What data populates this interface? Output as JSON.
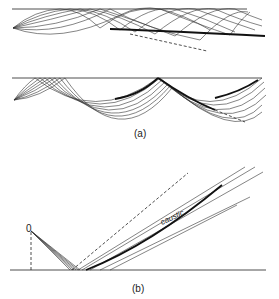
{
  "figure": {
    "panel_a": {
      "label": "(a)",
      "top_diagram": {
        "description": "rays from a source curving up to a boundary and reflecting, forming a caustic"
      },
      "bottom_diagram": {
        "description": "rays from a source bouncing along a boundary with a caustic"
      }
    },
    "panel_b": {
      "label": "(b)",
      "source_label": "0",
      "caustic_label": "caustic"
    }
  }
}
